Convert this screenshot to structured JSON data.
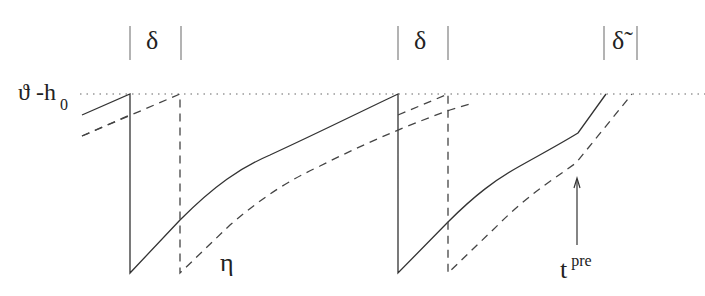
{
  "diagram": {
    "threshold_label": {
      "main": "ϑ -h",
      "subscript": "0"
    },
    "refractory_labels": [
      {
        "symbol": "δ",
        "x": 155
      },
      {
        "symbol": "δ",
        "x": 423
      },
      {
        "symbol": "δ̃",
        "x": 620
      }
    ],
    "eta_label": "η",
    "arrow_label": {
      "main": "t",
      "superscript": "pre"
    },
    "colors": {
      "line": "#333333",
      "dashed": "#444444",
      "bars": "#888888",
      "dotted": "#666666"
    },
    "series": [
      {
        "name": "membrane potential (solid)",
        "style": "solid"
      },
      {
        "name": "shifted potential (dashed)",
        "style": "dashed"
      },
      {
        "name": "threshold ϑ - h0",
        "style": "dotted"
      }
    ]
  }
}
